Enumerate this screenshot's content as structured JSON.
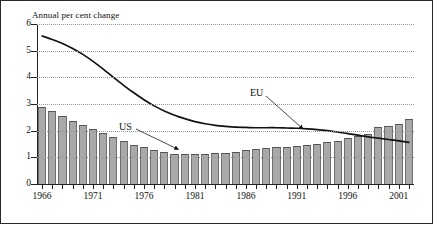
{
  "chart_data": {
    "type": "bar",
    "title": "Annual per cent change",
    "xlabel": "",
    "ylabel": "Annual per cent change",
    "ylim": [
      0,
      6
    ],
    "xlim": [
      1966,
      2002
    ],
    "yticks": [
      0,
      1,
      2,
      3,
      4,
      5,
      6
    ],
    "xticks": [
      1966,
      1971,
      1976,
      1981,
      1986,
      1991,
      1996,
      2001
    ],
    "grid": true,
    "legend_position": "inline-annotations",
    "categories": [
      1966,
      1967,
      1968,
      1969,
      1970,
      1971,
      1972,
      1973,
      1974,
      1975,
      1976,
      1977,
      1978,
      1979,
      1980,
      1981,
      1982,
      1983,
      1984,
      1985,
      1986,
      1987,
      1988,
      1989,
      1990,
      1991,
      1992,
      1993,
      1994,
      1995,
      1996,
      1997,
      1998,
      1999,
      2000,
      2001,
      2002
    ],
    "series": [
      {
        "name": "US",
        "render": "bar",
        "color": "#a9a9a9",
        "values": [
          2.89,
          2.73,
          2.54,
          2.36,
          2.21,
          2.07,
          1.91,
          1.76,
          1.6,
          1.48,
          1.38,
          1.28,
          1.2,
          1.14,
          1.12,
          1.11,
          1.13,
          1.15,
          1.18,
          1.21,
          1.28,
          1.32,
          1.34,
          1.37,
          1.4,
          1.41,
          1.46,
          1.51,
          1.56,
          1.63,
          1.72,
          1.8,
          1.86,
          2.12,
          2.19,
          2.26,
          2.42
        ]
      },
      {
        "name": "EU",
        "render": "line",
        "color": "#111111",
        "values": [
          5.55,
          5.42,
          5.27,
          5.08,
          4.86,
          4.6,
          4.31,
          4.0,
          3.7,
          3.42,
          3.16,
          2.93,
          2.74,
          2.58,
          2.45,
          2.34,
          2.26,
          2.2,
          2.16,
          2.13,
          2.12,
          2.11,
          2.11,
          2.11,
          2.1,
          2.09,
          2.07,
          2.04,
          2.0,
          1.95,
          1.89,
          1.83,
          1.77,
          1.72,
          1.67,
          1.62,
          1.56
        ]
      }
    ],
    "annotations": [
      {
        "label": "US",
        "target_series": "US"
      },
      {
        "label": "EU",
        "target_series": "EU"
      }
    ]
  },
  "labels": {
    "title": "Annual per cent change",
    "us": "US",
    "eu": "EU",
    "yticks": [
      "0",
      "1",
      "2",
      "3",
      "4",
      "5",
      "6"
    ],
    "xticks": [
      "1966",
      "1971",
      "1976",
      "1981",
      "1986",
      "1991",
      "1996",
      "2001"
    ]
  }
}
